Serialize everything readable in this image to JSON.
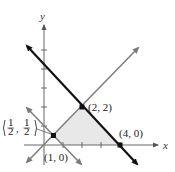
{
  "diagram": {
    "type": "linear-inequalities-graph",
    "axes": {
      "x_label": "x",
      "y_label": "y"
    },
    "origin_px": [
      44,
      145
    ],
    "unit_px": 19,
    "ticks": {
      "x": [
        1,
        2,
        3,
        4
      ],
      "y": [
        1,
        2,
        3,
        4
      ]
    },
    "lines": [
      {
        "name": "x+y=4",
        "color": "#111111",
        "width": 2.2
      },
      {
        "name": "y=x",
        "color": "#808080",
        "width": 1.6
      },
      {
        "name": "x+y=1",
        "color": "#808080",
        "width": 1.6
      }
    ],
    "shaded_region": {
      "color": "#e8e8e8",
      "vertices": [
        "(1/2, 1/2)",
        "(2, 2)",
        "(4, 0)",
        "(1, 0)"
      ]
    },
    "points": [
      {
        "label": "(2, 2)",
        "x": 2,
        "y": 2
      },
      {
        "label": "(4, 0)",
        "x": 4,
        "y": 0
      },
      {
        "label": "(1, 0)",
        "x": 1,
        "y": 0
      },
      {
        "label_num": "1",
        "label_den": "2",
        "x": 0.5,
        "y": 0.5
      }
    ]
  }
}
